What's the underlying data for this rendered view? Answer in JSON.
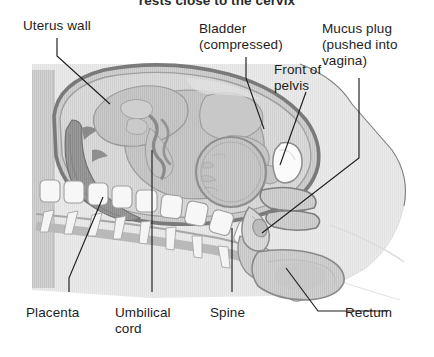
{
  "figure": {
    "caption_partial": "rests close to the cervix",
    "type": "anatomical-illustration",
    "background_color": "#ffffff",
    "ink_color": "#1d1d1d",
    "tones": {
      "body_tissue": "#d6d6d6",
      "uterus_fill": "#c9c9c9",
      "uterus_wall": "#9a9a9a",
      "amniotic_fluid": "#cfcfcf",
      "fetus": "#c2c2c2",
      "placenta": "#8d8d8d",
      "bone_white": "#f4f4f4",
      "outline": "#6b6b6b",
      "soft_outline": "#d9d9d9"
    }
  },
  "labels": {
    "uterus_wall": "Uterus wall",
    "bladder_line1": "Bladder",
    "bladder_line2": "(compressed)",
    "mucus_line1": "Mucus plug",
    "mucus_line2": "(pushed into",
    "mucus_line3": "vagina)",
    "front_line1": "Front of",
    "front_line2": "pelvis",
    "placenta": "Placenta",
    "umbilical_line1": "Umbilical",
    "umbilical_line2": "cord",
    "spine": "Spine",
    "rectum": "Rectum"
  },
  "structures": [
    {
      "name": "uterus-wall",
      "label": "Uterus wall"
    },
    {
      "name": "bladder",
      "label": "Bladder (compressed)"
    },
    {
      "name": "mucus-plug",
      "label": "Mucus plug (pushed into vagina)"
    },
    {
      "name": "front-of-pelvis",
      "label": "Front of pelvis"
    },
    {
      "name": "placenta",
      "label": "Placenta"
    },
    {
      "name": "umbilical-cord",
      "label": "Umbilical cord"
    },
    {
      "name": "spine",
      "label": "Spine"
    },
    {
      "name": "rectum",
      "label": "Rectum"
    },
    {
      "name": "fetus",
      "label": "Fetus"
    },
    {
      "name": "fetal-head",
      "label": "Fetal head (engaged)"
    }
  ]
}
